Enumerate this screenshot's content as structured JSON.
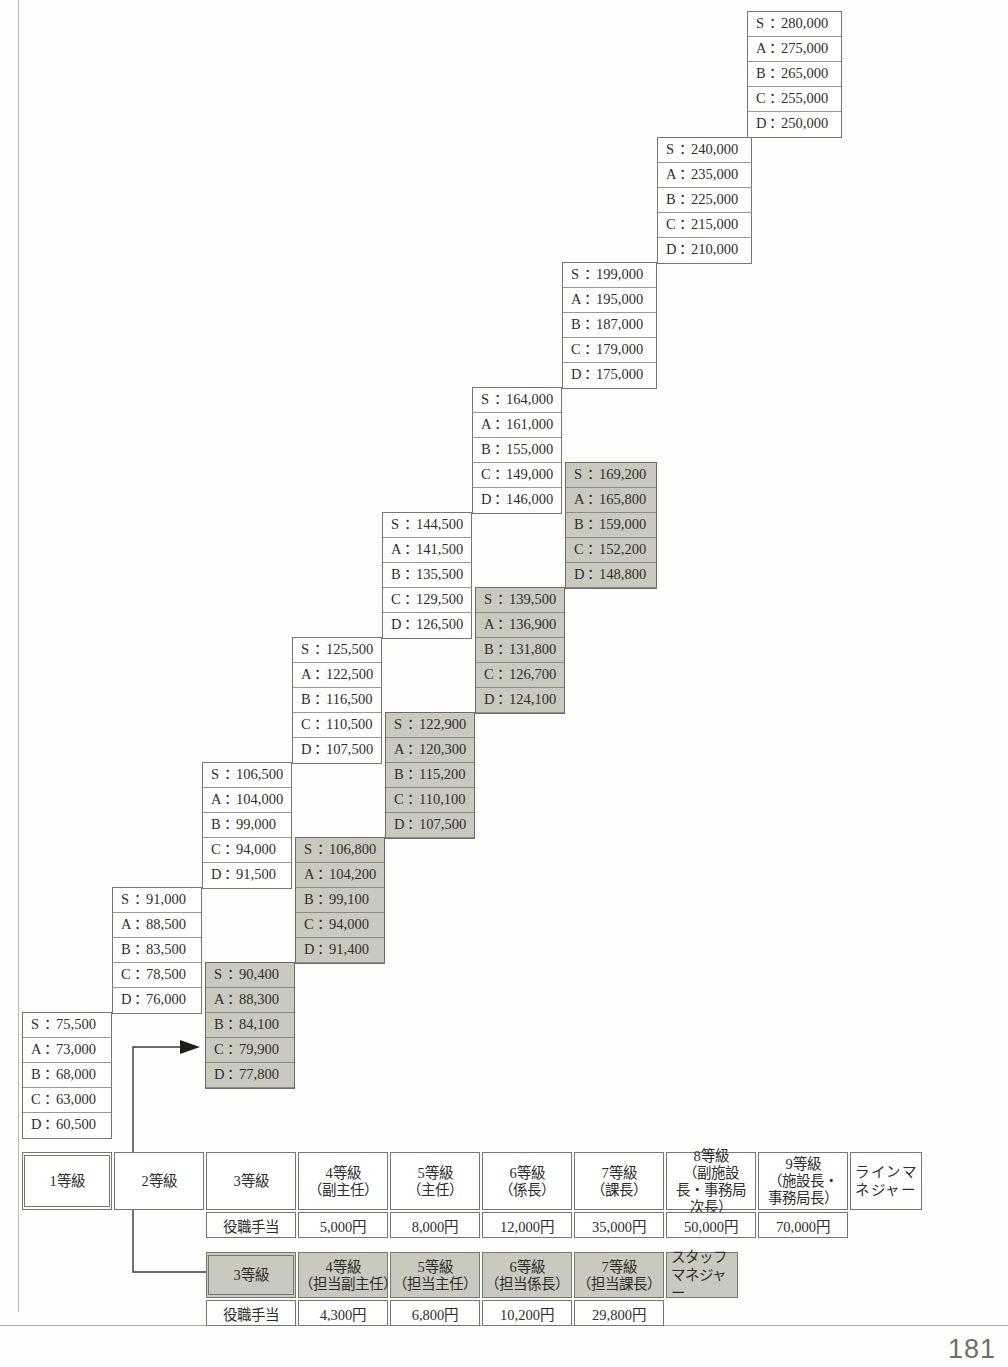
{
  "page": {
    "folio": "181"
  },
  "ladder": {
    "rank_order": [
      "S",
      "A",
      "B",
      "C",
      "D"
    ],
    "separator": "：",
    "columns": [
      {
        "id": "grade-1",
        "shaded": false,
        "left": 22,
        "top": 1012,
        "width": 90,
        "values": [
          "75,500",
          "73,000",
          "68,000",
          "63,000",
          "60,500"
        ]
      },
      {
        "id": "grade-2",
        "shaded": false,
        "left": 112,
        "top": 887,
        "width": 90,
        "values": [
          "91,000",
          "88,500",
          "83,500",
          "78,500",
          "76,000"
        ]
      },
      {
        "id": "grade-3",
        "shaded": false,
        "left": 202,
        "top": 762,
        "width": 90,
        "values": [
          "106,500",
          "104,000",
          "99,000",
          "94,000",
          "91,500"
        ]
      },
      {
        "id": "grade-4",
        "shaded": false,
        "left": 292,
        "top": 637,
        "width": 90,
        "values": [
          "125,500",
          "122,500",
          "116,500",
          "110,500",
          "107,500"
        ]
      },
      {
        "id": "grade-5",
        "shaded": false,
        "left": 382,
        "top": 512,
        "width": 90,
        "values": [
          "144,500",
          "141,500",
          "135,500",
          "129,500",
          "126,500"
        ]
      },
      {
        "id": "grade-6",
        "shaded": false,
        "left": 472,
        "top": 387,
        "width": 90,
        "values": [
          "164,000",
          "161,000",
          "155,000",
          "149,000",
          "146,000"
        ]
      },
      {
        "id": "grade-7",
        "shaded": false,
        "left": 562,
        "top": 262,
        "width": 95,
        "values": [
          "199,000",
          "195,000",
          "187,000",
          "179,000",
          "175,000"
        ]
      },
      {
        "id": "grade-8",
        "shaded": false,
        "left": 657,
        "top": 137,
        "width": 95,
        "values": [
          "240,000",
          "235,000",
          "225,000",
          "215,000",
          "210,000"
        ]
      },
      {
        "id": "grade-9",
        "shaded": false,
        "left": 747,
        "top": 11,
        "width": 95,
        "values": [
          "280,000",
          "275,000",
          "265,000",
          "255,000",
          "250,000"
        ]
      },
      {
        "id": "staff-grade-3",
        "shaded": true,
        "left": 205,
        "top": 962,
        "width": 90,
        "values": [
          "90,400",
          "88,300",
          "84,100",
          "79,900",
          "77,800"
        ]
      },
      {
        "id": "staff-grade-4",
        "shaded": true,
        "left": 295,
        "top": 837,
        "width": 90,
        "values": [
          "106,800",
          "104,200",
          "99,100",
          "94,000",
          "91,400"
        ]
      },
      {
        "id": "staff-grade-5",
        "shaded": true,
        "left": 385,
        "top": 712,
        "width": 90,
        "values": [
          "122,900",
          "120,300",
          "115,200",
          "110,100",
          "107,500"
        ]
      },
      {
        "id": "staff-grade-6",
        "shaded": true,
        "left": 475,
        "top": 587,
        "width": 90,
        "values": [
          "139,500",
          "136,900",
          "131,800",
          "126,700",
          "124,100"
        ]
      },
      {
        "id": "staff-grade-7",
        "shaded": true,
        "left": 565,
        "top": 462,
        "width": 92,
        "values": [
          "169,200",
          "165,800",
          "159,000",
          "152,200",
          "148,800"
        ]
      }
    ]
  },
  "line_table": {
    "grades": [
      {
        "label": "1等級",
        "sub": ""
      },
      {
        "label": "2等級",
        "sub": ""
      },
      {
        "label": "3等級",
        "sub": ""
      },
      {
        "label": "4等級",
        "sub": "（副主任）"
      },
      {
        "label": "5等級",
        "sub": "（主任）"
      },
      {
        "label": "6等級",
        "sub": "（係長）"
      },
      {
        "label": "7等級",
        "sub": "（課長）"
      },
      {
        "label": "8等級",
        "sub": "（副施設長・事務局次長）"
      },
      {
        "label": "9等級",
        "sub": "（施設長・事務局長）"
      }
    ],
    "manager_label": "ラインマネジャー",
    "allowance_header": "役職手当",
    "allowances": [
      "5,000円",
      "8,000円",
      "12,000円",
      "35,000円",
      "50,000円",
      "70,000円"
    ]
  },
  "staff_table": {
    "grades": [
      {
        "label": "3等級",
        "sub": ""
      },
      {
        "label": "4等級",
        "sub": "（担当副主任）"
      },
      {
        "label": "5等級",
        "sub": "（担当主任）"
      },
      {
        "label": "6等級",
        "sub": "（担当係長）"
      },
      {
        "label": "7等級",
        "sub": "（担当課長）"
      }
    ],
    "manager_label": "スタッフマネジャー",
    "allowance_header": "役職手当",
    "allowances": [
      "4,300円",
      "6,800円",
      "10,200円",
      "29,800円"
    ]
  },
  "colors": {
    "shaded_fill": "#c9c9bf",
    "border": "#77776d",
    "text": "#2e2e2b"
  }
}
